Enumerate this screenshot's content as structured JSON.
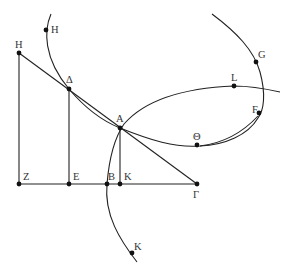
{
  "diagram": {
    "stroke_color": "#222222",
    "background": "#ffffff",
    "points": {
      "H_left": {
        "label": "H",
        "x": 19,
        "y": 53
      },
      "H_curve": {
        "label": "H",
        "x": 46,
        "y": 30
      },
      "Delta": {
        "label": "Δ",
        "x": 69,
        "y": 89
      },
      "A": {
        "label": "A",
        "x": 120,
        "y": 128
      },
      "Z": {
        "label": "Z",
        "x": 19,
        "y": 184
      },
      "E": {
        "label": "E",
        "x": 69,
        "y": 184
      },
      "B": {
        "label": "B",
        "x": 107,
        "y": 184
      },
      "K_base": {
        "label": "K",
        "x": 120,
        "y": 184
      },
      "Gamma": {
        "label": "Γ",
        "x": 197,
        "y": 184
      },
      "K_curve": {
        "label": "K",
        "x": 132,
        "y": 253
      },
      "Theta": {
        "label": "Θ",
        "x": 197,
        "y": 145
      },
      "L": {
        "label": "L",
        "x": 234,
        "y": 86
      },
      "G": {
        "label": "G",
        "x": 256,
        "y": 62
      },
      "F": {
        "label": "F",
        "x": 259,
        "y": 113
      }
    },
    "segments": [
      {
        "from": "H_left",
        "to": "Z"
      },
      {
        "from": "Delta",
        "to": "E"
      },
      {
        "from": "A",
        "to": "K_base"
      },
      {
        "from": "Z",
        "to": "Gamma"
      },
      {
        "from": "H_left",
        "to": "Gamma"
      }
    ],
    "curves": [
      {
        "name": "hyperbola-left-branch",
        "through": [
          "H_curve",
          "Delta",
          "A",
          "Theta"
        ]
      },
      {
        "name": "ellipse-arc",
        "through": [
          "K_curve",
          "B",
          "A",
          "L"
        ]
      },
      {
        "name": "parabola-right",
        "through": [
          "G",
          "F",
          "Theta"
        ]
      }
    ]
  }
}
